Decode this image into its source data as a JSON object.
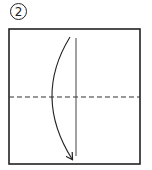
{
  "step": {
    "number": "2"
  },
  "diagram": {
    "paper_square": {
      "x": 9,
      "y": 29,
      "width": 131,
      "height": 135,
      "stroke": "#222222"
    },
    "valley_fold_line": {
      "y": 97,
      "x1": 9,
      "x2": 140,
      "dash": "5 3",
      "stroke": "#333333"
    },
    "vertical_reference_line": {
      "x": 76,
      "y1": 38,
      "y2": 156,
      "stroke": "#444444"
    },
    "fold_arrow": {
      "start": [
        70,
        37
      ],
      "control": [
        33,
        97
      ],
      "end": [
        72,
        159
      ],
      "stroke": "#222222",
      "direction": "down"
    }
  }
}
